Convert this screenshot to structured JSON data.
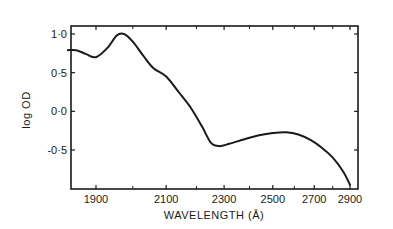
{
  "chart_data": {
    "type": "line",
    "title": "",
    "xlabel": "WAVELENGTH (Å)",
    "ylabel": "log OD",
    "x_scale": "reciprocal (linear in wavenumber)",
    "xlim": [
      1820,
      2920
    ],
    "ylim": [
      -0.95,
      1.1
    ],
    "grid": false,
    "legend": null,
    "x_ticks": [
      1900,
      2100,
      2300,
      2500,
      2700,
      2900
    ],
    "x_tick_labels": [
      "1900",
      "2100",
      "2300",
      "2500",
      "2700",
      "2900"
    ],
    "x_minor_ticks": [
      2000,
      2200,
      2400,
      2600,
      2800
    ],
    "y_ticks": [
      1.0,
      0.5,
      0.0,
      -0.5
    ],
    "y_tick_labels": [
      "1·0",
      "0·5",
      "0·0",
      "-0·5"
    ],
    "series": [
      {
        "name": "log OD",
        "x": [
          1830,
          1850,
          1875,
          1900,
          1930,
          1955,
          1975,
          2000,
          2030,
          2060,
          2100,
          2140,
          2180,
          2220,
          2250,
          2280,
          2320,
          2380,
          2440,
          2500,
          2560,
          2620,
          2680,
          2740,
          2800,
          2860,
          2900
        ],
        "y": [
          0.79,
          0.79,
          0.74,
          0.7,
          0.82,
          0.98,
          1.0,
          0.9,
          0.72,
          0.56,
          0.45,
          0.25,
          0.05,
          -0.2,
          -0.4,
          -0.45,
          -0.42,
          -0.36,
          -0.31,
          -0.28,
          -0.27,
          -0.3,
          -0.37,
          -0.47,
          -0.6,
          -0.78,
          -0.95
        ]
      }
    ]
  }
}
